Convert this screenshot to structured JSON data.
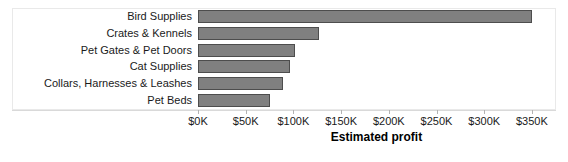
{
  "chart_data": {
    "type": "bar",
    "orientation": "horizontal",
    "title": "",
    "xlabel": "Estimated profit",
    "ylabel": "",
    "categories": [
      "Bird Supplies",
      "Crates & Kennels",
      "Pet Gates & Pet Doors",
      "Cat Supplies",
      "Collars, Harnesses & Leashes",
      "Pet Beds"
    ],
    "values": [
      350000,
      127000,
      102000,
      96000,
      89000,
      75000
    ],
    "xlim": [
      0,
      375000
    ],
    "xticks": [
      0,
      50000,
      100000,
      150000,
      200000,
      250000,
      300000,
      350000
    ],
    "xtick_labels": [
      "$0K",
      "$50K",
      "$100K",
      "$150K",
      "$200K",
      "$250K",
      "$300K",
      "$350K"
    ],
    "grid": false,
    "legend": null,
    "bar_color": "#808080",
    "bar_border_color": "#4d4d4d",
    "frame_color": "#e9e9e9",
    "text_color": "#1a1a1a"
  }
}
